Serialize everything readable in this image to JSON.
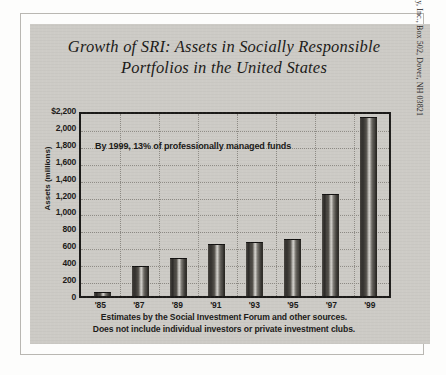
{
  "title": "Growth of SRI: Assets in Socially Responsible Portfolios in the United States",
  "annotation": "By 1999, 13% of professionally managed funds",
  "footnote_line1": "Estimates by the Social Investment Forum and other sources.",
  "footnote_line2": "Does not include individual investors or private investment clubs.",
  "source_credit": "Source: Good Money, Inc., Box 502, Dover, NH 03821",
  "colors": {
    "panel": "#cdcbc6",
    "ink": "#1b1a18",
    "grid": "#8e8b85",
    "bar_dark": "#26241f",
    "bar_light": "#d8d6d1"
  },
  "chart_data": {
    "type": "bar",
    "title": "Growth of SRI: Assets in Socially Responsible Portfolios in the United States",
    "xlabel": "",
    "ylabel": "Assets (millions)",
    "categories": [
      "'85",
      "'87",
      "'89",
      "'91",
      "'93",
      "'95",
      "'97",
      "'99"
    ],
    "values": [
      40,
      340,
      440,
      600,
      625,
      660,
      1200,
      2100
    ],
    "ylim": [
      0,
      2200
    ],
    "ytick_values": [
      2200,
      2000,
      1800,
      1600,
      1400,
      1200,
      1000,
      800,
      600,
      400,
      200,
      0
    ],
    "ytick_labels": [
      "$2,200",
      "2,000",
      "1,800",
      "1,600",
      "1,400",
      "1,200",
      "1,000",
      "800",
      "600",
      "400",
      "200",
      "0"
    ],
    "grid": true,
    "legend": "none",
    "annotations": [
      "By 1999, 13% of professionally managed funds"
    ]
  }
}
